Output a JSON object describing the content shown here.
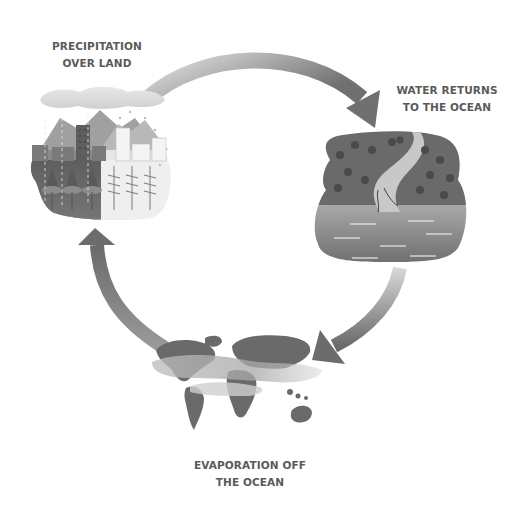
{
  "diagram": {
    "stages": [
      {
        "id": "precipitation",
        "line1": "PRECIPITATION",
        "line2": "OVER LAND",
        "icon": "city-forest-rain-illustration"
      },
      {
        "id": "runoff",
        "line1": "WATER RETURNS",
        "line2": "TO THE OCEAN",
        "icon": "river-to-ocean-illustration"
      },
      {
        "id": "evaporation",
        "line1": "EVAPORATION OFF",
        "line2": "THE OCEAN",
        "icon": "world-map-illustration"
      }
    ],
    "arrows": [
      {
        "from": "precipitation",
        "to": "runoff",
        "direction": "clockwise"
      },
      {
        "from": "runoff",
        "to": "evaporation",
        "direction": "clockwise"
      },
      {
        "from": "evaporation",
        "to": "precipitation",
        "direction": "clockwise"
      }
    ],
    "colors": {
      "text": "#5a5a5a",
      "arrow_dark": "#6e6e6e",
      "arrow_light": "#d4d4d4",
      "land_dark": "#6a6a6a",
      "water": "#8e8e8e",
      "background": "#ffffff"
    }
  }
}
